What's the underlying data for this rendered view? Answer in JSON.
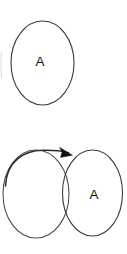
{
  "diagram": {
    "background_color": "#ffffff",
    "stroke_color": "#3a3a3a",
    "arrow_color": "#111111",
    "label_color": "#111111",
    "figures": [
      {
        "id": "top-figure",
        "kind": "single-state",
        "nodes": [
          {
            "id": "top-state-a",
            "label": "A",
            "shape": "ellipse",
            "cx": 42.5,
            "cy": 63,
            "rx": 31.5,
            "ry": 42,
            "label_x": 40,
            "label_y": 62
          }
        ],
        "edges": []
      },
      {
        "id": "bottom-figure",
        "kind": "two-overlapping-states-with-self-arrow",
        "nodes": [
          {
            "id": "bottom-state-left",
            "label": "",
            "shape": "ellipse",
            "cx": 36,
            "cy": 194,
            "rx": 33,
            "ry": 44,
            "label_x": 0,
            "label_y": 0
          },
          {
            "id": "bottom-state-a",
            "label": "A",
            "shape": "ellipse",
            "cx": 92.5,
            "cy": 193,
            "rx": 30,
            "ry": 43,
            "label_x": 94,
            "label_y": 195
          }
        ],
        "edges": [
          {
            "id": "arrow-left-to-right",
            "from": "bottom-state-left",
            "to": "bottom-state-a",
            "label": "",
            "style": "curved-arc",
            "head": "filled-triangle",
            "head_x": 69,
            "head_y": 153
          }
        ]
      }
    ]
  }
}
